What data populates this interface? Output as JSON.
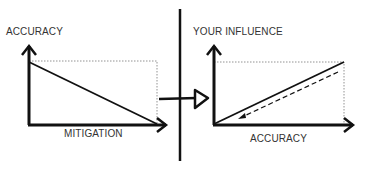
{
  "diagram": {
    "left_chart": {
      "y_label": "ACCURACY",
      "x_label": "MITIGATION",
      "relationship": "decreasing"
    },
    "right_chart": {
      "y_label": "YOUR INFLUENCE",
      "x_label": "ACCURACY",
      "relationship": "increasing",
      "dashed_arrow": "downward along trend"
    },
    "connector": "arrow from left chart to right chart crossing vertical divider"
  },
  "colors": {
    "line": "#111111",
    "text": "#333333",
    "dotted": "#777777",
    "background": "#ffffff"
  }
}
